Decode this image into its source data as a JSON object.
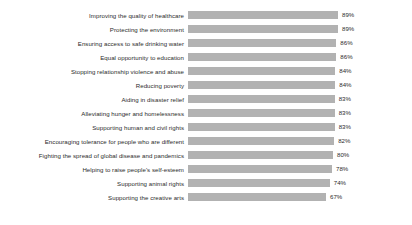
{
  "chart_data": {
    "type": "bar",
    "orientation": "horizontal",
    "title": "",
    "subtitle": "",
    "xlabel": "",
    "ylabel": "",
    "grid": false,
    "legend": false,
    "legend_position": "none",
    "value_suffix": "%",
    "xlim": [
      56,
      89
    ],
    "bar_color": "#b2b2b2",
    "text_color": "#2b2b2b",
    "background_color": "#ffffff",
    "categories": [
      "Improving the quality of healthcare",
      "Protecting the environment",
      "Ensuring access to safe drinking water",
      "Equal opportunity to education",
      "Stopping relationship violence and abuse",
      "Reducing poverty",
      "Aiding in disaster relief",
      "Alleviating hunger and homelessness",
      "Supporting human and civil rights",
      "Encouraging tolerance for people who are different",
      "Fighting the spread of global disease and pandemics",
      "Helping to raise people's self-esteem",
      "Supporting animal rights",
      "Supporting the creative arts"
    ],
    "values": [
      89,
      89,
      86,
      86,
      84,
      84,
      83,
      83,
      83,
      82,
      80,
      78,
      74,
      67
    ],
    "value_labels": [
      "89%",
      "89%",
      "86%",
      "86%",
      "84%",
      "84%",
      "83%",
      "83%",
      "83%",
      "82%",
      "80%",
      "78%",
      "74%",
      "67%"
    ]
  }
}
